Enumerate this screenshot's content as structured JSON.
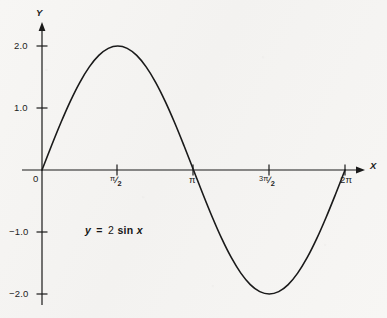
{
  "figure": {
    "background_color": "#f6f5f3",
    "ink_color": "#1a1a1a",
    "axis_x_name": "X",
    "axis_y_name": "Y",
    "origin_label": "0"
  },
  "annotation": {
    "lhs": "y",
    "equals": "=",
    "coefficient": "2",
    "function": "sin",
    "argument": "x",
    "full_text": "y = 2 sin x"
  },
  "ticks": {
    "x": [
      {
        "label": "0",
        "kind": "plain",
        "value": 0
      },
      {
        "label": "π/2",
        "kind": "fraction",
        "numerator": "π",
        "denominator": "2",
        "value": 1.5707963
      },
      {
        "label": "π",
        "kind": "plain",
        "value": 3.1415927
      },
      {
        "label": "3π/2",
        "kind": "fraction",
        "numerator": "3π",
        "denominator": "2",
        "value": 4.712389
      },
      {
        "label": "2π",
        "kind": "plain",
        "value": 6.2831853
      }
    ],
    "y": [
      {
        "label": "2.0",
        "value": 2
      },
      {
        "label": "1.0",
        "value": 1
      },
      {
        "label": "−1.0",
        "value": -1
      },
      {
        "label": "−2.0",
        "value": -2
      }
    ]
  },
  "chart_data": {
    "type": "line",
    "title": "",
    "subtitle": "",
    "xlabel": "X",
    "ylabel": "Y",
    "equation": "y = 2 sin x",
    "amplitude": 2,
    "grid": false,
    "legend": null,
    "legend_position": "none",
    "xlim": [
      0,
      6.2831853
    ],
    "ylim": [
      -2.0,
      2.0
    ],
    "xticks": [
      0,
      1.5707963,
      3.1415927,
      4.712389,
      6.2831853
    ],
    "xticklabels": [
      "0",
      "π/2",
      "π",
      "3π/2",
      "2π"
    ],
    "yticks": [
      2.0,
      1.0,
      -1.0,
      -2.0
    ],
    "yticklabels": [
      "2.0",
      "1.0",
      "−1.0",
      "−2.0"
    ],
    "annotations": [
      {
        "text": "y = 2 sin x",
        "x": 1.35,
        "y": -1.0
      }
    ],
    "series": [
      {
        "name": "y = 2 sin x",
        "color": "#1a1a1a",
        "x": [
          0.0,
          0.1963,
          0.3927,
          0.589,
          0.7854,
          0.9817,
          1.1781,
          1.3744,
          1.5708,
          1.7671,
          1.9635,
          2.1598,
          2.3562,
          2.5525,
          2.7489,
          2.9452,
          3.1416,
          3.3379,
          3.5343,
          3.7306,
          3.927,
          4.1233,
          4.3197,
          4.516,
          4.7124,
          4.9087,
          5.1051,
          5.3014,
          5.4978,
          5.6941,
          5.8905,
          6.0868,
          6.2832
        ],
        "y": [
          0.0,
          0.3902,
          0.7654,
          1.1111,
          1.4142,
          1.6629,
          1.8478,
          1.9616,
          2.0,
          1.9616,
          1.8478,
          1.6629,
          1.4142,
          1.1111,
          0.7654,
          0.3902,
          0.0,
          -0.3902,
          -0.7654,
          -1.1111,
          -1.4142,
          -1.6629,
          -1.8478,
          -1.9616,
          -2.0,
          -1.9616,
          -1.8478,
          -1.6629,
          -1.4142,
          -1.1111,
          -0.7654,
          -0.3902,
          0.0
        ]
      }
    ],
    "key_points": [
      {
        "label": "origin / zero crossing",
        "x": 0,
        "y": 0
      },
      {
        "label": "maximum",
        "x": 1.5707963,
        "y": 2.0
      },
      {
        "label": "zero crossing",
        "x": 3.1415927,
        "y": 0
      },
      {
        "label": "minimum",
        "x": 4.712389,
        "y": -2.0
      },
      {
        "label": "zero crossing",
        "x": 6.2831853,
        "y": 0
      }
    ]
  }
}
